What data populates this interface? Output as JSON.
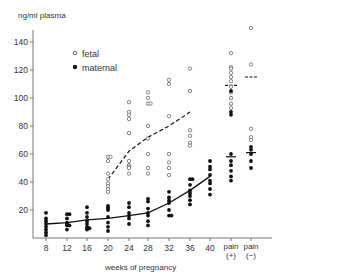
{
  "chart_data": {
    "type": "scatter",
    "title": "",
    "ylabel": "ng/ml plasma",
    "xlabel": "weeks of pregnancy",
    "ylim": [
      0,
      150
    ],
    "yticks": [
      20,
      40,
      60,
      80,
      100,
      120,
      140
    ],
    "categories": [
      "8",
      "12",
      "16",
      "20",
      "24",
      "28",
      "32",
      "36",
      "40",
      "pain (+)",
      "pain (−)"
    ],
    "legend": [
      {
        "name": "fetal",
        "marker": "open-circle"
      },
      {
        "name": "maternal",
        "marker": "filled-circle"
      }
    ],
    "legend_position": "upper-left",
    "grid": false,
    "series": [
      {
        "name": "fetal",
        "marker": "open-circle",
        "points": {
          "20": [
            58,
            58,
            55,
            46,
            42,
            39,
            37,
            35,
            33
          ],
          "24": [
            97,
            90,
            88,
            85,
            75,
            55,
            52,
            51,
            50,
            46
          ],
          "28": [
            104,
            100,
            96,
            96,
            80,
            71,
            60,
            50,
            46
          ],
          "32": [
            113,
            110,
            87,
            60,
            54,
            50,
            45
          ],
          "36": [
            121,
            105,
            77,
            73,
            68,
            66
          ],
          "pain (+)": [
            132,
            122,
            121,
            118,
            115,
            112,
            108,
            104,
            100,
            96,
            93
          ],
          "pain (−)": [
            150,
            124,
            78,
            72,
            70
          ]
        }
      },
      {
        "name": "maternal",
        "marker": "filled-circle",
        "points": {
          "8": [
            18,
            14,
            12,
            10,
            8,
            6,
            4,
            2
          ],
          "12": [
            17,
            17,
            14,
            11,
            10,
            9,
            9,
            6
          ],
          "16": [
            22,
            18,
            15,
            12,
            10,
            8,
            7,
            7,
            6
          ],
          "20": [
            23,
            22,
            21,
            20,
            15,
            11,
            8,
            5
          ],
          "24": [
            25,
            22,
            18,
            16,
            14,
            10
          ],
          "28": [
            28,
            26,
            21,
            18,
            16,
            12,
            9
          ],
          "32": [
            33,
            29,
            27,
            25,
            20,
            16,
            16
          ],
          "36": [
            42,
            42,
            38,
            34,
            32,
            30,
            27,
            24
          ],
          "40": [
            55,
            51,
            49,
            45,
            41,
            39,
            35,
            31
          ],
          "pain (+)": [
            105,
            90,
            88,
            60,
            55,
            52,
            48,
            44,
            41
          ],
          "pain (−)": [
            65,
            63,
            60,
            55,
            50
          ]
        }
      }
    ],
    "mean_lines": [
      {
        "name": "maternal mean",
        "style": "solid",
        "x": [
          "8",
          "12",
          "16",
          "20",
          "24",
          "28",
          "32",
          "36",
          "40"
        ],
        "y": [
          10,
          11,
          13,
          14,
          16,
          18,
          25,
          34,
          44
        ]
      },
      {
        "name": "fetal mean",
        "style": "dashed",
        "x": [
          "20",
          "24",
          "28",
          "32",
          "36"
        ],
        "y": [
          42,
          62,
          72,
          80,
          90
        ]
      }
    ],
    "group_means": [
      {
        "category": "pain (+)",
        "fetal": 109,
        "maternal": 58
      },
      {
        "category": "pain (−)",
        "fetal": 115,
        "maternal": 61
      }
    ]
  }
}
